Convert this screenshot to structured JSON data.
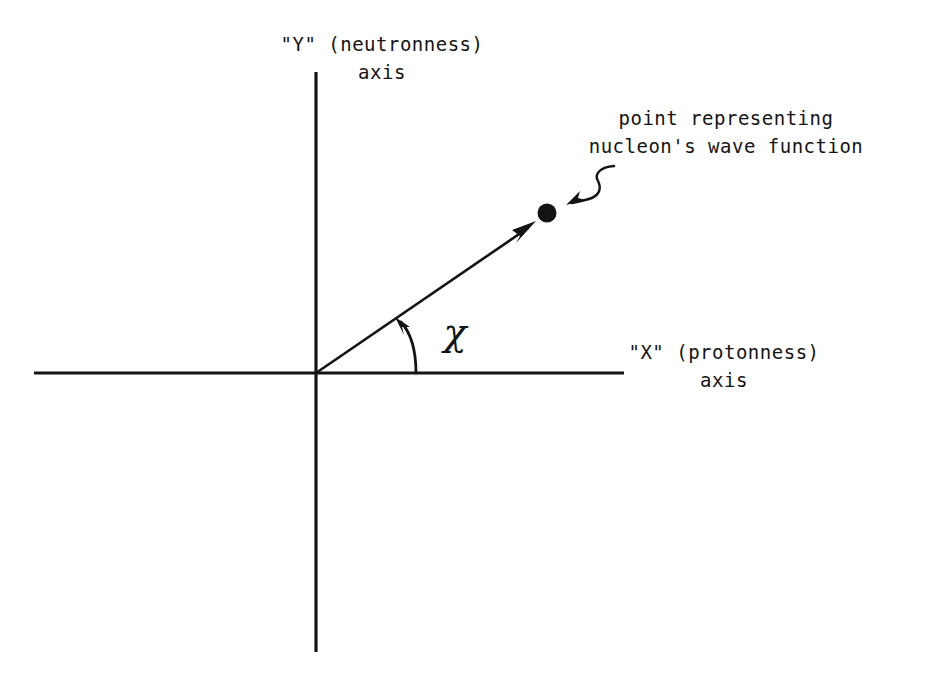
{
  "figure": {
    "background_color": "#ffffff",
    "ink_color": "#141414"
  },
  "axes": {
    "vertical": {
      "label_line1": "\"Y\" (neutronness)",
      "label_line2": "axis",
      "name": "Y",
      "quantity": "neutronness",
      "x": 316,
      "y_top": 72,
      "y_bottom": 652
    },
    "horizontal": {
      "label_line1": "\"X\" (protonness)",
      "label_line2": "axis",
      "name": "X",
      "quantity": "protonness",
      "y": 373,
      "x_left": 34,
      "x_right": 624
    },
    "origin": {
      "x": 316,
      "y": 373
    }
  },
  "vector": {
    "name": "state-vector",
    "from": {
      "x": 316,
      "y": 373
    },
    "to": {
      "x": 536,
      "y": 222
    },
    "angle_degrees": 34.5
  },
  "angle": {
    "symbol": "χ",
    "symbol_name": "chi",
    "arc_start": {
      "x": 416,
      "y": 373
    },
    "arc_end": {
      "x": 397,
      "y": 320
    }
  },
  "point": {
    "center": {
      "x": 547,
      "y": 213
    },
    "radius": 9,
    "annotation_line1": "point representing",
    "annotation_line2": "nucleon's wave function"
  },
  "pointer": {
    "name": "curly-arrow",
    "start": {
      "x": 613,
      "y": 166
    },
    "end": {
      "x": 568,
      "y": 204
    }
  }
}
